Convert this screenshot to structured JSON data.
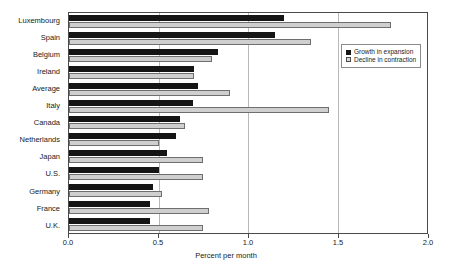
{
  "chart_data": {
    "type": "bar",
    "orientation": "horizontal",
    "title": "",
    "xlabel": "Percent per month",
    "ylabel": "",
    "xlim": [
      0.0,
      2.0
    ],
    "xticks": [
      0.0,
      0.5,
      1.0,
      1.5,
      2.0
    ],
    "xtick_labels": [
      "0.0",
      "0.5",
      "1.0",
      "1.5",
      "2.0"
    ],
    "grid": true,
    "grid_axis": "x",
    "legend_position": "upper right",
    "categories": [
      "Luxembourg",
      "Spain",
      "Belgium",
      "Ireland",
      "Average",
      "Italy",
      "Canada",
      "Netherlands",
      "Japan",
      "U.S.",
      "Germany",
      "France",
      "U.K."
    ],
    "series": [
      {
        "name": "Growth in expansion",
        "color": "#151515",
        "values": [
          1.2,
          1.15,
          0.83,
          0.7,
          0.72,
          0.69,
          0.62,
          0.6,
          0.55,
          0.5,
          0.47,
          0.45,
          0.45
        ]
      },
      {
        "name": "Decline in contraction",
        "color": "#cfcfcf",
        "values": [
          1.8,
          1.35,
          0.8,
          0.7,
          0.9,
          1.45,
          0.65,
          0.5,
          0.75,
          0.75,
          0.52,
          0.78,
          0.75
        ]
      }
    ]
  },
  "legend": {
    "items": [
      {
        "label": "Growth in expansion"
      },
      {
        "label": "Decline in contraction"
      }
    ]
  }
}
